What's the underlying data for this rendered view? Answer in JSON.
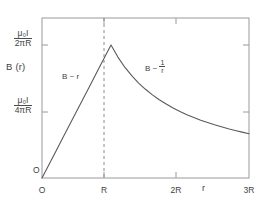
{
  "chart_data": {
    "type": "line",
    "title": "",
    "subtitle": "",
    "xlabel": "r",
    "ylabel": "B (r)",
    "xlim": [
      0,
      3
    ],
    "ylim": [
      0,
      1.12
    ],
    "grid": false,
    "legend_position": "none",
    "x_ticks": [
      {
        "value": 0,
        "label": "O"
      },
      {
        "value": 1,
        "label": "R"
      },
      {
        "value": 2,
        "label": "2R"
      },
      {
        "value": 3,
        "label": "3R"
      }
    ],
    "y_ticks": [
      {
        "value": 1.0,
        "label_numerator": "μ₀I",
        "label_denominator": "2πR"
      },
      {
        "value": 0.5,
        "label_numerator": "μ₀I",
        "label_denominator": "4πR"
      }
    ],
    "series": [
      {
        "name": "B(r)",
        "color": "#5a5a5a",
        "x": [
          0,
          0.1,
          0.2,
          0.3,
          0.4,
          0.5,
          0.6,
          0.7,
          0.8,
          0.9,
          1.0,
          1.1,
          1.2,
          1.3,
          1.4,
          1.5,
          1.6,
          1.7,
          1.8,
          1.9,
          2.0,
          2.1,
          2.2,
          2.3,
          2.4,
          2.5,
          2.6,
          2.7,
          2.8,
          2.9,
          3.0
        ],
        "values": [
          0,
          0.1,
          0.2,
          0.3,
          0.4,
          0.5,
          0.6,
          0.7,
          0.8,
          0.9,
          1.0,
          0.909,
          0.833,
          0.769,
          0.714,
          0.667,
          0.625,
          0.588,
          0.556,
          0.526,
          0.5,
          0.476,
          0.455,
          0.435,
          0.417,
          0.4,
          0.385,
          0.37,
          0.357,
          0.345,
          0.333
        ]
      }
    ],
    "annotations": [
      {
        "name": "linear-region",
        "text_prefix": "B ~ r",
        "x": 0.45,
        "y": 0.62
      },
      {
        "name": "inverse-region",
        "text_prefix": "B ~ ",
        "fraction_numerator": "1",
        "fraction_denominator": "r",
        "x": 1.55,
        "y": 0.8
      }
    ],
    "reference_lines": [
      {
        "name": "r-equals-R",
        "orientation": "vertical",
        "value": 1,
        "style": "dashed",
        "color": "#8c8c8c"
      }
    ],
    "markers": [
      {
        "name": "origin-label",
        "text": "O",
        "x": 0.02,
        "y": 0.06
      }
    ]
  },
  "axes": {
    "y_title": "B (r)",
    "x_title": "r",
    "origin_label": "O"
  },
  "ticks": {
    "y_top": {
      "numerator": "μ₀I",
      "denominator": "2πR"
    },
    "y_mid": {
      "numerator": "μ₀I",
      "denominator": "4πR"
    },
    "x": {
      "zero": "O",
      "one_R": "R",
      "two_R": "2R",
      "three_R": "3R"
    }
  },
  "annotations": {
    "linear": "B ~ r",
    "inverse_prefix": "B ~ ",
    "inverse_numerator": "1",
    "inverse_denominator": "r"
  },
  "style": {
    "curve_color": "#5a5a5a",
    "frame_color": "#9a9a9a",
    "dash_color": "#8c8c8c",
    "text_color": "#3f3f3f",
    "background": "#ffffff"
  }
}
